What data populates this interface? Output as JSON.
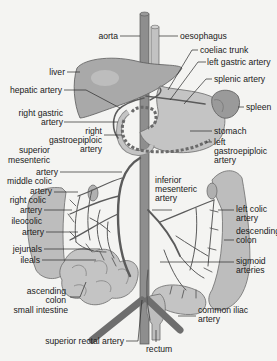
{
  "diagram": {
    "colors": {
      "background": "#f4f4f2",
      "organ": "#a9a9a9",
      "organ_light": "#c4c4c4",
      "artery": "#5b5b5b",
      "text": "#1a1a1a"
    },
    "labels": {
      "aorta": "aorta",
      "oesophagus": "oesophagus",
      "coeliac_trunk": "coeliac trunk",
      "left_gastric_artery": "left gastric artery",
      "splenic_artery": "splenic artery",
      "liver": "liver",
      "hepatic_artery": "hepatic artery",
      "spleen": "spleen",
      "right_gastric_artery_1": "right gastric",
      "right_gastric_artery_2": "artery",
      "right_gastroepiploic_1": "right",
      "right_gastroepiploic_2": "gastroepiploic",
      "right_gastroepiploic_3": "artery",
      "stomach": "stomach",
      "left_gastroepiploic_1": "left",
      "left_gastroepiploic_2": "gastroepiploic",
      "left_gastroepiploic_3": "artery",
      "superior_mesenteric_1": "superior",
      "superior_mesenteric_2": "mesenteric",
      "superior_mesenteric_3": "artery",
      "inferior_mesenteric_1": "inferior",
      "inferior_mesenteric_2": "mesenteric",
      "inferior_mesenteric_3": "artery",
      "middle_colic_1": "middle colic",
      "middle_colic_2": "artery",
      "left_colic_1": "left colic",
      "left_colic_2": "artery",
      "right_colic_1": "right colic",
      "right_colic_2": "artery",
      "descending_colon_1": "descending",
      "descending_colon_2": "colon",
      "ileocolic_1": "ileocolic",
      "ileocolic_2": "artery",
      "jejunals": "jejunals",
      "ileals": "ileals",
      "sigmoid_1": "sigmoid",
      "sigmoid_2": "arteries",
      "ascending_colon_1": "ascending",
      "ascending_colon_2": "colon",
      "small_intestine": "small intestine",
      "common_iliac_1": "common iliac",
      "common_iliac_2": "artery",
      "superior_rectal_artery": "superior rectal artery",
      "rectum": "rectum"
    }
  }
}
